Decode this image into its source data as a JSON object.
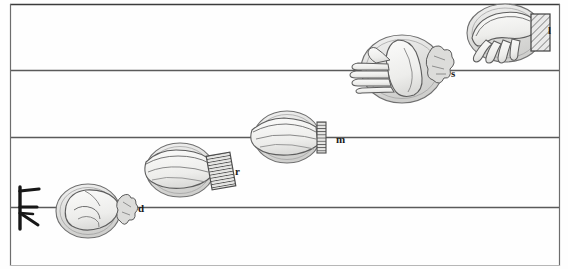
{
  "figure": {
    "kind": "hand-sign-staff-diagram",
    "title": "",
    "background_color": "#fefefe",
    "ink_color": "#2b2b2b",
    "fill_color": "#d9d9d9",
    "width": 568,
    "height": 269
  },
  "staff": {
    "line_color": "#5a5a5a",
    "border_color": "#3a3a3a",
    "left_margin_x": 10,
    "right_margin_x": 560,
    "lines": [
      {
        "name": "line-top",
        "y": 4
      },
      {
        "name": "line-2",
        "y": 70
      },
      {
        "name": "line-3",
        "y": 137
      },
      {
        "name": "line-4",
        "y": 207
      }
    ],
    "bottom_edge_y": 266
  },
  "clef": {
    "name": "fork-clef-glyph",
    "x": 12,
    "y": 186,
    "width": 30,
    "height": 44,
    "description": "vertical stroke with three horizontal prongs"
  },
  "signs": [
    {
      "id": "d",
      "label": "d",
      "label_x": 141,
      "label_y": 209,
      "oval_cx": 88,
      "oval_cy": 211,
      "oval_rx": 32,
      "oval_ry": 27,
      "hand": "closed-fist",
      "cuff": "blob",
      "cuff_x": 122,
      "cuff_y": 193,
      "on_line_y": 207
    },
    {
      "id": "r",
      "label": "r",
      "label_x": 237,
      "label_y": 172,
      "oval_cx": 180,
      "oval_cy": 170,
      "oval_rx": 34,
      "oval_ry": 27,
      "hand": "flat-hand-fingers-left",
      "cuff": "hatched-rect",
      "cuff_x": 209,
      "cuff_y": 155,
      "on_line_y": 137
    },
    {
      "id": "m",
      "label": "m",
      "label_x": 338,
      "label_y": 140,
      "oval_cx": 287,
      "oval_cy": 137,
      "oval_rx": 33,
      "oval_ry": 26,
      "hand": "flat-hand-fingers-left",
      "cuff": "ribbed-rect",
      "cuff_x": 317,
      "cuff_y": 122,
      "on_line_y": 137
    },
    {
      "id": "s",
      "label": "s",
      "label_x": 453,
      "label_y": 74,
      "oval_cx": 402,
      "oval_cy": 69,
      "oval_rx": 41,
      "oval_ry": 34,
      "hand": "vertical-hand-fingers-left",
      "cuff": "blob",
      "cuff_x": 432,
      "cuff_y": 46,
      "on_line_y": 70
    },
    {
      "id": "l",
      "label": "l",
      "label_x": 549,
      "label_y": 32,
      "oval_cx": 505,
      "oval_cy": 33,
      "oval_rx": 38,
      "oval_ry": 29,
      "hand": "drooping-hand-fingers-down",
      "cuff": "hatched-rect",
      "cuff_x": 532,
      "cuff_y": 15,
      "on_line_y": 4
    }
  ]
}
